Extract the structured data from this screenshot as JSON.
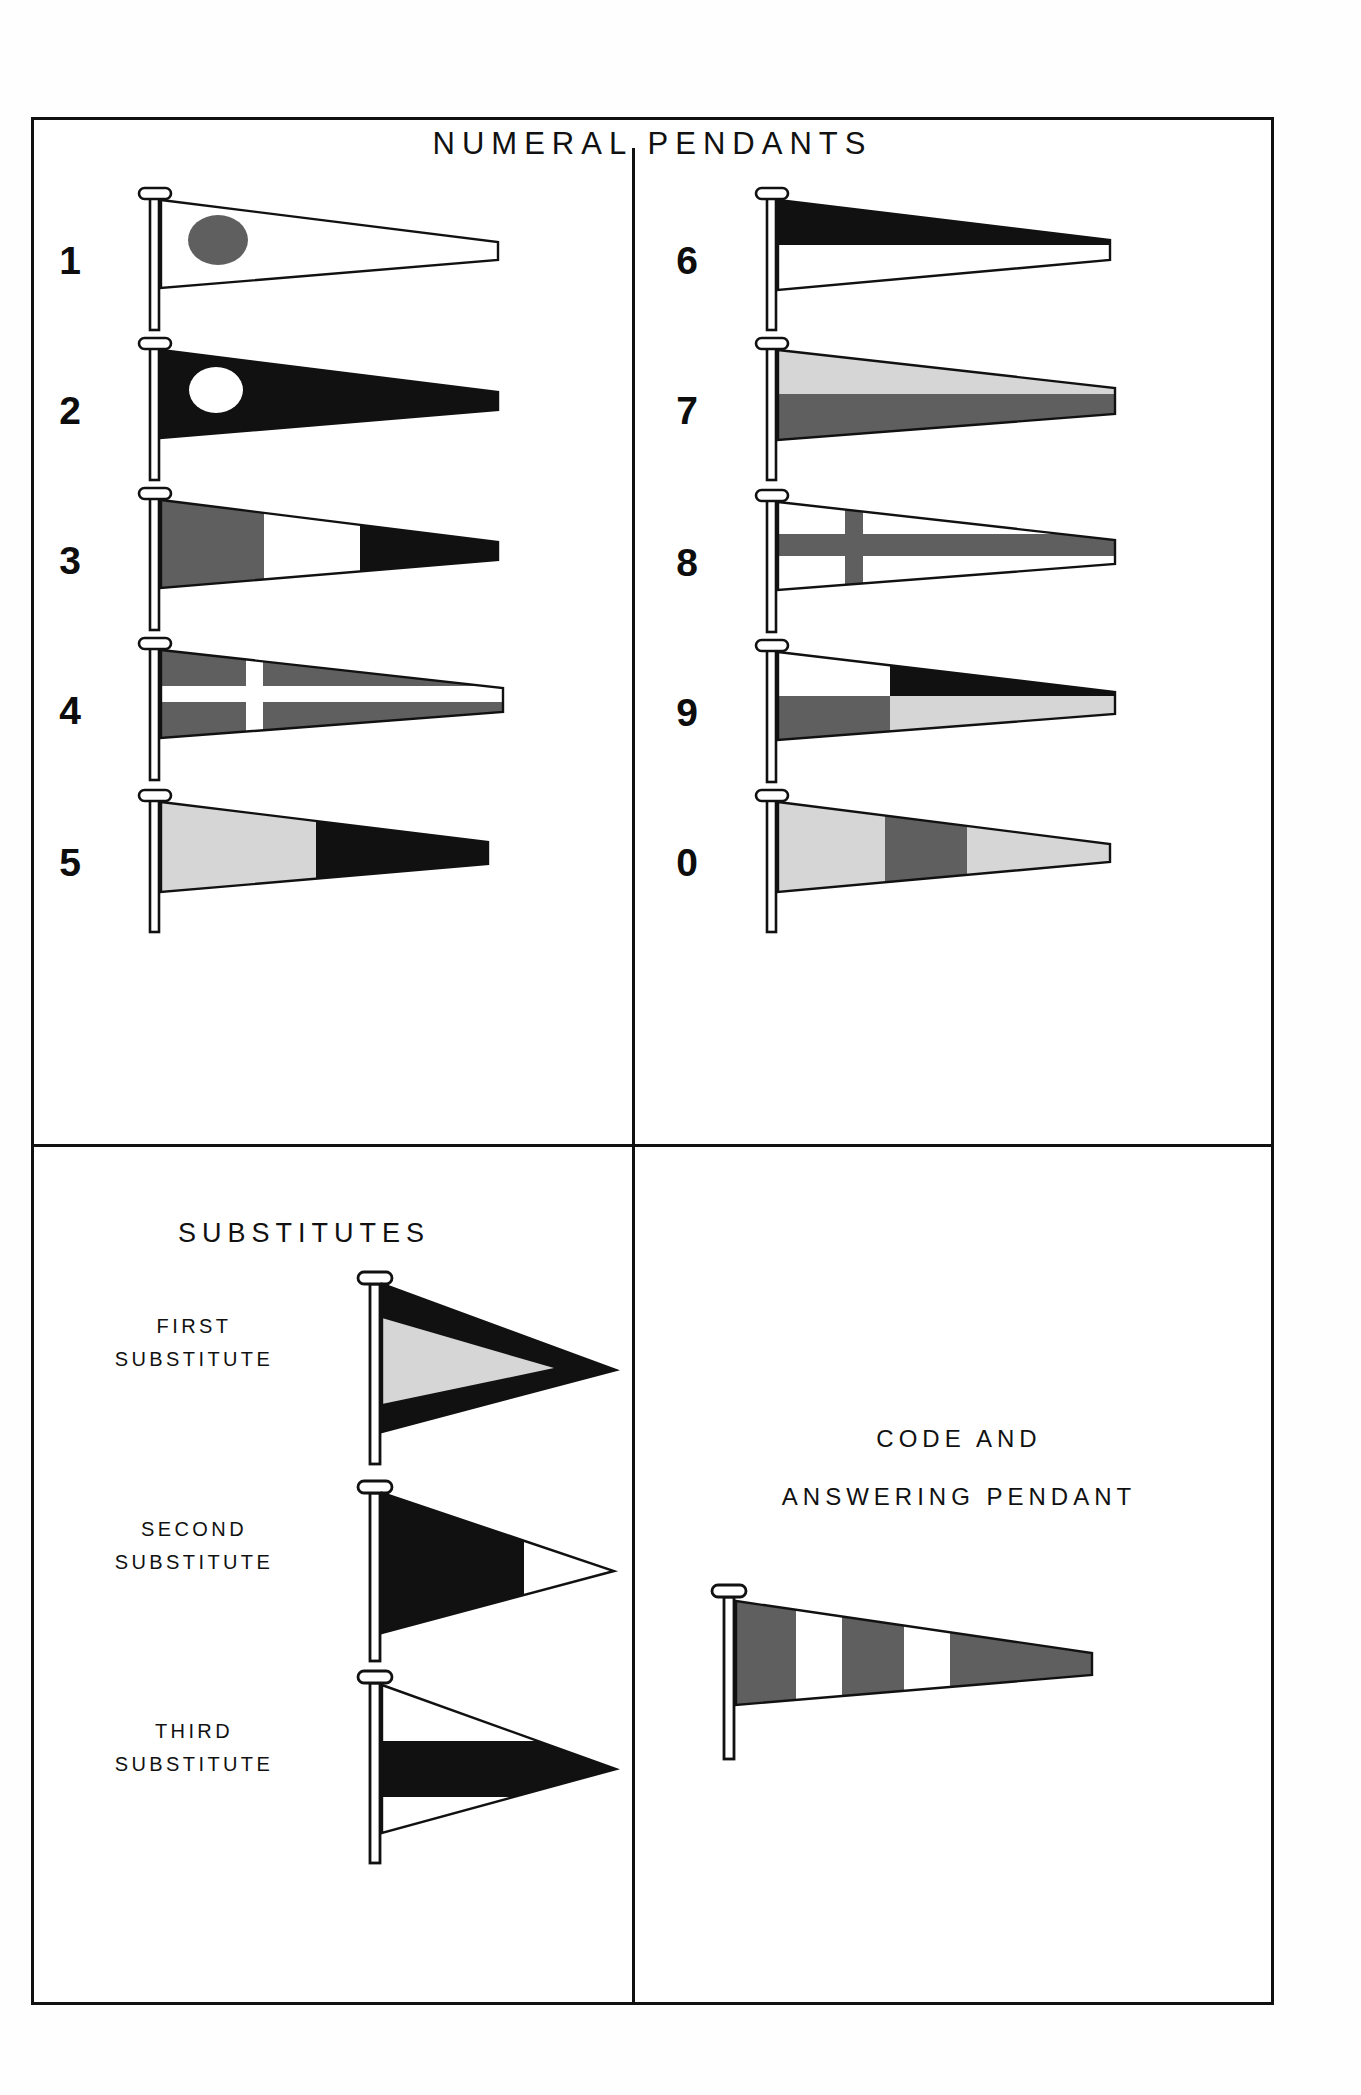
{
  "document": {
    "title": "NUMERAL PENDANTS",
    "substitutes_title": "SUBSTITUTES",
    "code_title_line1": "CODE AND",
    "code_title_line2": "ANSWERING  PENDANT"
  },
  "colors": {
    "ink": "#111111",
    "red": "#5f5f5f",
    "blue": "#111111",
    "yellow": "#d6d6d6",
    "white": "#ffffff",
    "staff": "#ffffff"
  },
  "numeral_pendants": {
    "left_column": [
      {
        "label": "1",
        "name": "pendant-one",
        "pattern": "white field with red disc"
      },
      {
        "label": "2",
        "name": "pendant-two",
        "pattern": "blue field with white disc"
      },
      {
        "label": "3",
        "name": "pendant-three",
        "pattern": "vertical red, white, blue"
      },
      {
        "label": "4",
        "name": "pendant-four",
        "pattern": "red field with white cross"
      },
      {
        "label": "5",
        "name": "pendant-five",
        "pattern": "vertical yellow, blue"
      }
    ],
    "right_column": [
      {
        "label": "6",
        "name": "pendant-six",
        "pattern": "horizontal blue over white"
      },
      {
        "label": "7",
        "name": "pendant-seven",
        "pattern": "horizontal yellow over red"
      },
      {
        "label": "8",
        "name": "pendant-eight",
        "pattern": "white field with red horizontal band"
      },
      {
        "label": "9",
        "name": "pendant-nine",
        "pattern": "quartered white, blue, red, yellow"
      },
      {
        "label": "0",
        "name": "pendant-zero",
        "pattern": "vertical yellow, red, yellow"
      }
    ]
  },
  "substitutes": [
    {
      "line1": "FIRST",
      "line2": "SUBSTITUTE",
      "name": "first-substitute",
      "pattern": "blue triangular pennant with yellow chevron"
    },
    {
      "line1": "SECOND",
      "line2": "SUBSTITUTE",
      "name": "second-substitute",
      "pattern": "blue rectangle with white triangle fly"
    },
    {
      "line1": "THIRD",
      "line2": "SUBSTITUTE",
      "name": "third-substitute",
      "pattern": "white triangular pennant with black horizontal band"
    }
  ],
  "code_pendant": {
    "name": "code-and-answering-pendant",
    "pattern": "vertical red, white, red, white, red stripes"
  }
}
